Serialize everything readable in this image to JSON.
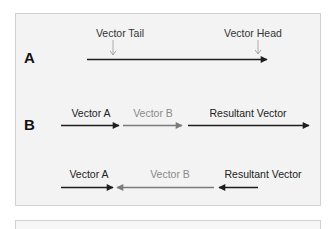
{
  "colors": {
    "dark_arrow": "#1e1e1e",
    "gray_arrow": "#7a7a7a",
    "panel_bg": "#f3f3f3",
    "panel_border": "#d2d2d2",
    "dark_text": "#222222",
    "gray_text": "#8a8a8a"
  },
  "section_a": {
    "label": "A",
    "tail_label": "Vector Tail",
    "head_label": "Vector Head"
  },
  "section_b": {
    "label": "B",
    "row1": {
      "vector_a": "Vector A",
      "vector_b": "Vector B",
      "resultant": "Resultant Vector"
    },
    "row2": {
      "vector_a": "Vector A",
      "vector_b": "Vector B",
      "resultant": "Resultant Vector"
    }
  }
}
